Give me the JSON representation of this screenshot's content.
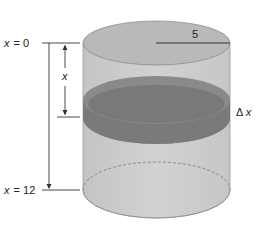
{
  "diagram": {
    "type": "cylinder-slicing",
    "labels": {
      "top": "x = 0",
      "top_var": "x",
      "top_eq": "= 0",
      "bottom_var": "x",
      "bottom_eq": "= 12",
      "depth": "x",
      "radius": "5",
      "slice_thickness_delta": "Δ",
      "slice_thickness_var": "x"
    },
    "colors": {
      "cylinder_body": "#c8c8c8",
      "cylinder_top": "#b4b4b4",
      "slice_dark": "#6e6e6e",
      "slice_side": "#858585",
      "lines": "#333333"
    },
    "values": {
      "radius": 5,
      "x_start": 0,
      "x_end": 12
    }
  }
}
